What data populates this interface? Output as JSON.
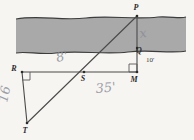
{
  "figure": {
    "background_color": "#f7f5f2",
    "river_color": "#a9a9a9",
    "ink_color": "#4a4a4a",
    "handwriting_color": "#8c8f99",
    "points": [
      {
        "id": "P",
        "label": "P",
        "x": 137,
        "y": 16,
        "label_x": 136,
        "label_y": 10
      },
      {
        "id": "Q",
        "label": "Q",
        "x": 137,
        "y": 48,
        "label_x": 139,
        "label_y": 53
      },
      {
        "id": "R",
        "label": "R",
        "x": 22,
        "y": 72,
        "label_x": 14,
        "label_y": 71
      },
      {
        "id": "S",
        "label": "S",
        "x": 84,
        "y": 72,
        "label_x": 83,
        "label_y": 81
      },
      {
        "id": "M",
        "label": "M",
        "x": 137,
        "y": 72,
        "label_x": 134,
        "label_y": 82
      },
      {
        "id": "T",
        "label": "T",
        "x": 27,
        "y": 123,
        "label_x": 25,
        "label_y": 133
      }
    ],
    "segments": [
      {
        "name": "segment-R-M",
        "from": "R",
        "to": "M"
      },
      {
        "name": "segment-R-T",
        "from": "R",
        "to": "T"
      },
      {
        "name": "segment-T-P",
        "from": "T",
        "to": "P"
      },
      {
        "name": "segment-P-M",
        "from": "P",
        "to": "M"
      }
    ],
    "right_angles": [
      {
        "name": "right-angle-at-R",
        "vertex": "R"
      },
      {
        "name": "right-angle-at-M",
        "vertex": "M"
      }
    ],
    "dimensions": [
      {
        "name": "dimension-PQ",
        "value": "x",
        "style": "handwritten",
        "x": 140,
        "y": 38
      },
      {
        "name": "dimension-QM",
        "value": "10'",
        "style": "printed",
        "x": 146,
        "y": 62
      },
      {
        "name": "dimension-RS",
        "value": "8'",
        "style": "handwritten",
        "x": 57,
        "y": 62
      },
      {
        "name": "dimension-SM",
        "value": "35'",
        "style": "handwritten",
        "x": 96,
        "y": 93
      },
      {
        "name": "dimension-RT",
        "value": "16",
        "style": "handwritten",
        "x": 7,
        "y": 103
      }
    ],
    "river": {
      "name": "river-band",
      "left": 16,
      "right": 186,
      "top_y": 18,
      "bottom_y": 52
    }
  }
}
